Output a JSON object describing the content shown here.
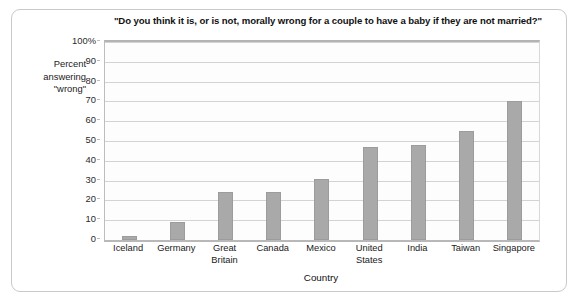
{
  "chart_data": {
    "type": "bar",
    "title": "\"Do you think it is, or is not, morally wrong for a couple to have a baby if they are not married?\"",
    "xlabel": "Country",
    "ylabel": "Percent answering \"wrong\"",
    "ylabel_lines": [
      "Percent",
      "answering",
      "\"wrong\""
    ],
    "categories": [
      "Iceland",
      "Germany",
      "Great Britain",
      "Canada",
      "Mexico",
      "United States",
      "India",
      "Taiwan",
      "Singapore"
    ],
    "category_label_lines": [
      "Iceland",
      "Germany",
      "Great\nBritain",
      "Canada",
      "Mexico",
      "United\nStates",
      "India",
      "Taiwan",
      "Singapore"
    ],
    "values": [
      2,
      9,
      24,
      24,
      31,
      47,
      48,
      55,
      70
    ],
    "ylim": [
      0,
      100
    ],
    "ytick_values": [
      0,
      10,
      20,
      30,
      40,
      50,
      60,
      70,
      80,
      90,
      100
    ],
    "ytick_labels": [
      "0",
      "10",
      "20",
      "30",
      "40",
      "50",
      "60",
      "70",
      "80",
      "90",
      "100%"
    ],
    "grid": "horizontal",
    "legend": "none",
    "bar_color": "#a9a9a9",
    "gridline_color": "#d3d3d3",
    "plot_background": "#fdfdfd",
    "frame_color": "#c9c9c9"
  }
}
